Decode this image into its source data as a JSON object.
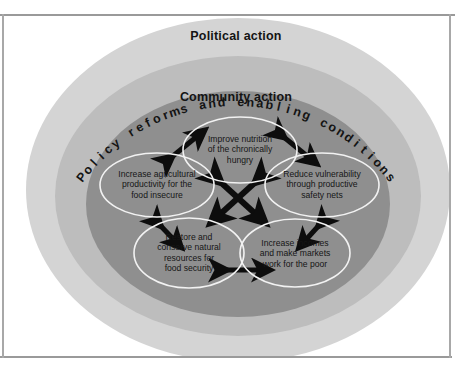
{
  "figure": {
    "name": "food-security-concentric-framework",
    "bands": [
      {
        "id": "political",
        "label": "Political action",
        "color": "#d4d4d4"
      },
      {
        "id": "policy",
        "label": "Policy reforms and enabling conditions",
        "color": "#bdbdbd"
      },
      {
        "id": "community",
        "label": "Community action",
        "color": "#8f8f8f"
      }
    ],
    "nodes": [
      {
        "id": "nutrition",
        "label": "Improve nutrition\nof the chronically\nhungry",
        "cx": 240,
        "cy": 150,
        "rx": 57,
        "ry": 33
      },
      {
        "id": "agriculture",
        "label": "Increase agricultural\nproductivity for the\nfood insecure",
        "cx": 157,
        "cy": 185,
        "rx": 57,
        "ry": 32
      },
      {
        "id": "vulnerability",
        "label": "Reduce vulnerability\nthrough productive\nsafety nets",
        "cx": 322,
        "cy": 185,
        "rx": 57,
        "ry": 32
      },
      {
        "id": "resources",
        "label": "Restore and\nconserve natural\nresources for\nfood security",
        "cx": 189,
        "cy": 253,
        "rx": 55,
        "ry": 35
      },
      {
        "id": "incomes",
        "label": "Increase incomes\nand make markets\nwork for the poor",
        "cx": 295,
        "cy": 253,
        "rx": 55,
        "ry": 34
      }
    ],
    "connectors": [
      {
        "id": "agriculture-nutrition",
        "kind": "double-arrow-diagonal"
      },
      {
        "id": "nutrition-vulnerability",
        "kind": "double-arrow-diagonal"
      },
      {
        "id": "agriculture-resources",
        "kind": "double-arrow-diagonal"
      },
      {
        "id": "vulnerability-incomes",
        "kind": "double-arrow-diagonal"
      },
      {
        "id": "resources-incomes",
        "kind": "double-arrow-horizontal"
      },
      {
        "id": "center-cross",
        "kind": "four-way-cross-arrow"
      }
    ],
    "colors": {
      "outer_band": "#d4d4d4",
      "middle_band": "#bdbdbd",
      "inner_band": "#8f8f8f",
      "ellipse_stroke": "#f2f2f2",
      "arrow_fill": "#0d0d0d",
      "text": "#161616",
      "page_rule": "#9a9a9a",
      "background": "#ffffff"
    }
  }
}
